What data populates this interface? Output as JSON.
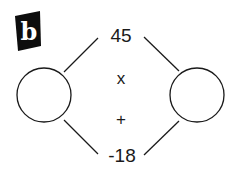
{
  "panel_label": "b",
  "diagram": {
    "type": "diamond-problem",
    "top_value": "45",
    "bottom_value": "-18",
    "operators": {
      "upper": "x",
      "lower": "+"
    },
    "left_circle_value": "",
    "right_circle_value": ""
  },
  "colors": {
    "stroke": "#1a1a1a",
    "badge": "#0d0d0d",
    "background": "#ffffff"
  }
}
